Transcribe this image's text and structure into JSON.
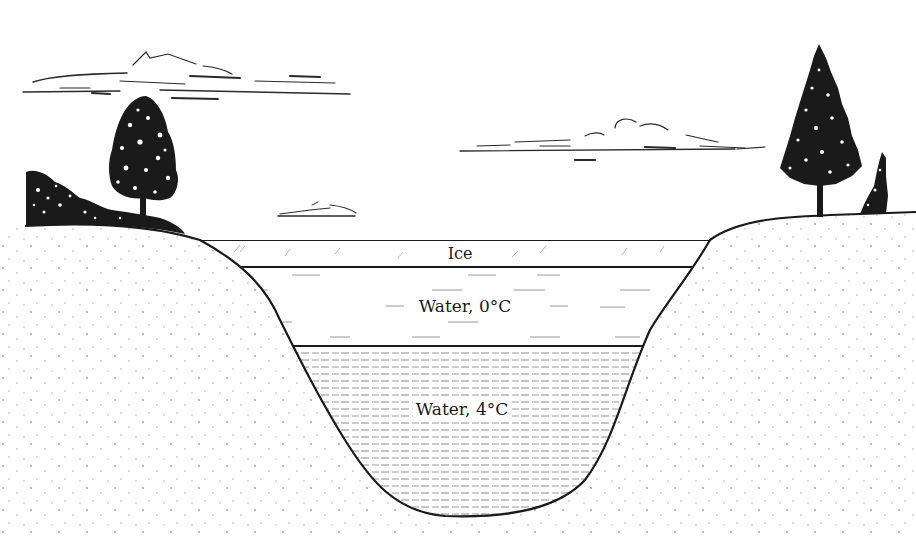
{
  "diagram": {
    "type": "cross-section",
    "layers": [
      {
        "id": "ice",
        "label": "Ice"
      },
      {
        "id": "water-0",
        "label": "Water, 0°C"
      },
      {
        "id": "water-4",
        "label": "Water, 4°C"
      }
    ],
    "scenery": {
      "trees": [
        "deciduous-tree-left",
        "conifer-tree-right",
        "small-conifer-far-right"
      ],
      "shrubs": [
        "bush-left"
      ],
      "clouds": [
        "cloud-upper-left",
        "cloud-center-right",
        "cloud-small-center"
      ]
    },
    "colors": {
      "ink": "#1a1a1a",
      "background": "#ffffff",
      "ground_dots": "#9a9a9a",
      "dash": "#8a8a8a"
    }
  }
}
